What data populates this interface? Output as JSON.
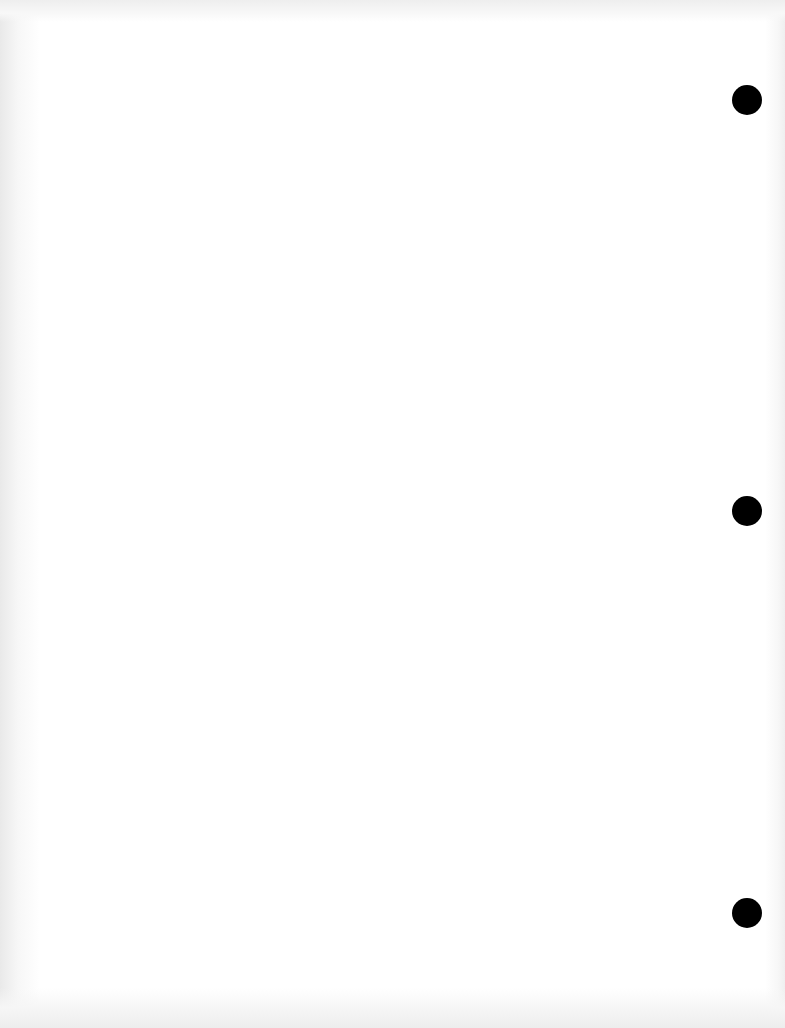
{
  "document": {
    "type": "blank scanned page",
    "background_color": "#ffffff",
    "punch_holes": [
      {
        "cx": 747,
        "cy": 100,
        "diameter": 30,
        "color": "#000000"
      },
      {
        "cx": 747,
        "cy": 511,
        "diameter": 30,
        "color": "#000000"
      },
      {
        "cx": 747,
        "cy": 913,
        "diameter": 30,
        "color": "#000000"
      }
    ],
    "bleed_through_text": {
      "top": "",
      "bottom": ""
    }
  }
}
